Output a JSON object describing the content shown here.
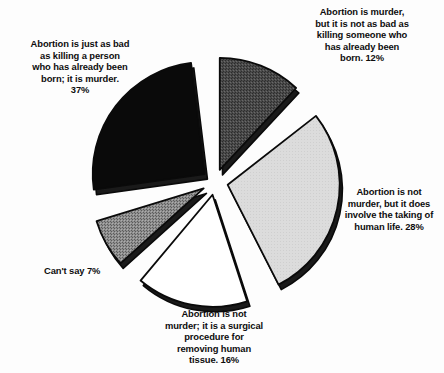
{
  "chart_data": {
    "type": "pie",
    "title": "",
    "subtitle": "",
    "xlabel": "",
    "ylabel": "",
    "legend_position": "none",
    "grid": false,
    "units": "percent",
    "total": 100,
    "exploded": true,
    "categories": [
      "Abortion is murder, but it is not as bad as killing someone who has already been born.",
      "Abortion is not murder, but it does involve the taking of human life.",
      "Abortion is not murder; it is a surgical procedure for removing human tissue.",
      "Can't say",
      "Abortion is just as bad as killing a person who has already been born; it is murder."
    ],
    "values": [
      12,
      28,
      16,
      7,
      37
    ],
    "slices": [
      {
        "id": "murder-not-as-bad",
        "label": "Abortion is murder,\nbut it is not as bad as\nkilling someone who\nhas already been\nborn.  12%",
        "value": 12,
        "value_text": "12%",
        "fill": "#4e4e4e",
        "pattern": "dark-stipple",
        "start_angle_deg": 0,
        "end_angle_deg": 43
      },
      {
        "id": "not-murder-taking-life",
        "label": "Abortion is not\nmurder, but it does\ninvolve the taking of\nhuman life.  28%",
        "value": 28,
        "value_text": "28%",
        "fill": "#d9d9d9",
        "pattern": "light-flat",
        "start_angle_deg": 52,
        "end_angle_deg": 153
      },
      {
        "id": "not-murder-surgical",
        "label": "Abortion is not\nmurder; it is a surgical\nprocedure for\nremoving human\ntissue.  16%",
        "value": 16,
        "value_text": "16%",
        "fill": "#ffffff",
        "pattern": "white-flat",
        "start_angle_deg": 162,
        "end_angle_deg": 220
      },
      {
        "id": "cant-say",
        "label": "Can't say  7%",
        "value": 7,
        "value_text": "7%",
        "fill": "#8a8a8a",
        "pattern": "medium-crosshatch",
        "start_angle_deg": 228,
        "end_angle_deg": 253
      },
      {
        "id": "just-as-bad-murder",
        "label": "Abortion is just as bad\nas killing a person\nwho has already been\nborn; it is murder.\n37%",
        "value": 37,
        "value_text": "37%",
        "fill": "#0a0a0a",
        "pattern": "black-flat",
        "start_angle_deg": 262,
        "end_angle_deg": 353
      }
    ],
    "colors": {
      "background": "#fdfdfd",
      "outline": "#0a0a0a",
      "text": "#0d0d0d",
      "slice_black": "#0a0a0a",
      "slice_dark_gray": "#4e4e4e",
      "slice_medium_gray": "#8a8a8a",
      "slice_light_gray": "#d9d9d9",
      "slice_white": "#ffffff"
    }
  }
}
